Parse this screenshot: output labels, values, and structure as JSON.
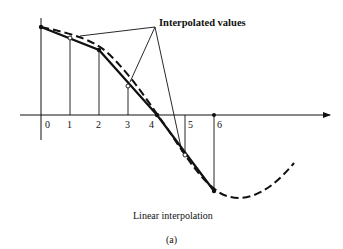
{
  "diagram": {
    "annotation": "Interpolated values",
    "caption": "Linear interpolation",
    "subcaption": "(a)",
    "x_tick_labels": [
      "0",
      "1",
      "2",
      "3",
      "4",
      "5",
      "6"
    ],
    "sample_points": [
      {
        "label": "0",
        "x": 41,
        "y": 27
      },
      {
        "label": "1",
        "x": 70,
        "y": 38
      },
      {
        "label": "2",
        "x": 99,
        "y": 50
      },
      {
        "label": "3",
        "x": 128,
        "y": 86
      },
      {
        "label": "4",
        "x": 157,
        "y": 115
      },
      {
        "label": "5",
        "x": 185,
        "y": 155
      },
      {
        "label": "6",
        "x": 214,
        "y": 191
      }
    ],
    "interpolated_points": [
      "1",
      "3",
      "5"
    ],
    "colors": {
      "ink": "#111111",
      "background": "#ffffff"
    }
  }
}
